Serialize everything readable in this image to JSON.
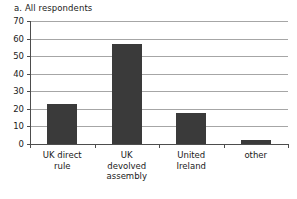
{
  "chart_data": {
    "type": "bar",
    "title": "a. All respondents",
    "xlabel": "",
    "ylabel": "",
    "categories": [
      "UK direct rule",
      "UK devolved assembly",
      "United Ireland",
      "other"
    ],
    "category_label_lines": [
      [
        "UK direct",
        "rule"
      ],
      [
        "UK",
        "devolved",
        "assembly"
      ],
      [
        "United",
        "Ireland"
      ],
      [
        "other"
      ]
    ],
    "values": [
      22.5,
      57,
      17.5,
      2.5
    ],
    "ylim": [
      0,
      70
    ],
    "yticks": [
      0,
      10,
      20,
      30,
      40,
      50,
      60,
      70
    ],
    "ytick_labels": [
      "0",
      "10",
      "20",
      "30",
      "40",
      "50",
      "60",
      "70"
    ],
    "grid": "horizontal",
    "legend": "none",
    "bar_color": "#3a3a3a",
    "grid_color": "#a6a6a6",
    "axis_color": "#4d4d4d",
    "background": "#ffffff"
  }
}
